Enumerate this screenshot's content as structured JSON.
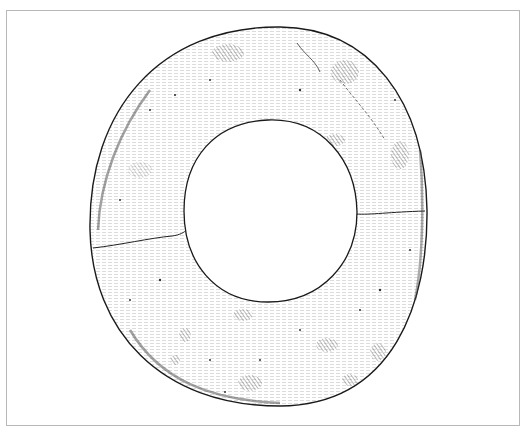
{
  "figure": {
    "frame_color": "#b8b8b8",
    "ink_color": "#1a1a1a",
    "hatch_color": "#555555",
    "outer": {
      "cx": 270,
      "cy": 216,
      "rx": 176,
      "ry": 190
    },
    "inner": {
      "cx": 270,
      "cy": 211,
      "rx": 86,
      "ry": 91
    }
  }
}
